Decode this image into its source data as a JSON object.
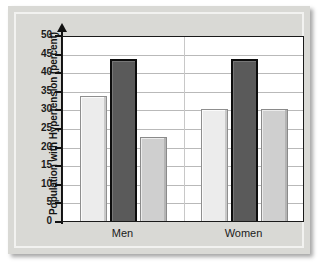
{
  "chart_data": {
    "type": "bar",
    "title": "",
    "subtitle": "",
    "xlabel": "",
    "ylabel": "Population with Hypertension (percent)",
    "categories": [
      "Men",
      "Women"
    ],
    "series": [
      {
        "name": "series-1",
        "color": "#ececec",
        "values": [
          33.5,
          30.0
        ]
      },
      {
        "name": "series-2",
        "color": "#5a5a5a",
        "values": [
          43.5,
          43.5
        ]
      },
      {
        "name": "series-3",
        "color": "#cfcfcf",
        "values": [
          22.5,
          30.0
        ]
      }
    ],
    "ylim": [
      0,
      50
    ],
    "ytick_values": [
      0,
      5,
      10,
      15,
      20,
      25,
      30,
      35,
      40,
      45,
      50
    ],
    "ytick_labels": [
      "0",
      "5",
      "10",
      "15",
      "20",
      "25",
      "30",
      "35",
      "40",
      "45",
      "50"
    ],
    "grid": true,
    "grid_axis": "y",
    "legend": false,
    "legend_position": "none",
    "annotations": []
  },
  "figure": {
    "panel_color": "#d9d9d5",
    "plot_background": "#ffffff",
    "axis_color": "#111111",
    "gridline_color": "#b9b9b9"
  }
}
